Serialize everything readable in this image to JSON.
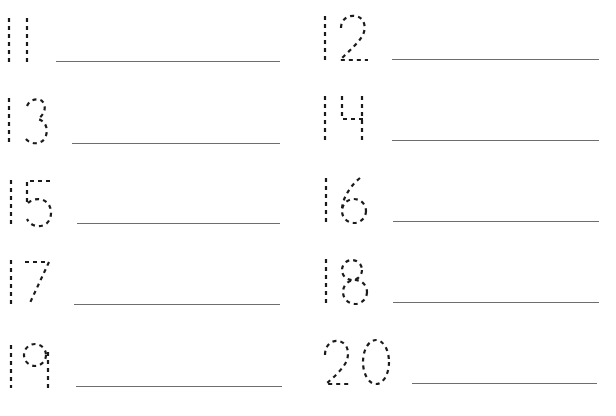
{
  "worksheet": {
    "type": "number tracing practice",
    "colors": {
      "background": "#ffffff",
      "dash_stroke": "#1a1a1a",
      "writing_line": "#6e6e6e"
    },
    "items": [
      {
        "number": "11",
        "column": "left",
        "row": 1,
        "line": {
          "x1": 56,
          "x2": 280,
          "y": 61
        }
      },
      {
        "number": "12",
        "column": "right",
        "row": 1,
        "line": {
          "x1": 392,
          "x2": 599,
          "y": 59
        }
      },
      {
        "number": "13",
        "column": "left",
        "row": 2,
        "line": {
          "x1": 72,
          "x2": 280,
          "y": 143
        }
      },
      {
        "number": "14",
        "column": "right",
        "row": 2,
        "line": {
          "x1": 392,
          "x2": 599,
          "y": 140
        }
      },
      {
        "number": "15",
        "column": "left",
        "row": 3,
        "line": {
          "x1": 77,
          "x2": 280,
          "y": 223
        }
      },
      {
        "number": "16",
        "column": "right",
        "row": 3,
        "line": {
          "x1": 393,
          "x2": 599,
          "y": 221
        }
      },
      {
        "number": "17",
        "column": "left",
        "row": 4,
        "line": {
          "x1": 74,
          "x2": 280,
          "y": 304
        }
      },
      {
        "number": "18",
        "column": "right",
        "row": 4,
        "line": {
          "x1": 393,
          "x2": 599,
          "y": 302
        }
      },
      {
        "number": "19",
        "column": "left",
        "row": 5,
        "line": {
          "x1": 76,
          "x2": 282,
          "y": 386
        }
      },
      {
        "number": "20",
        "column": "right",
        "row": 5,
        "line": {
          "x1": 412,
          "x2": 597,
          "y": 383
        }
      }
    ]
  }
}
